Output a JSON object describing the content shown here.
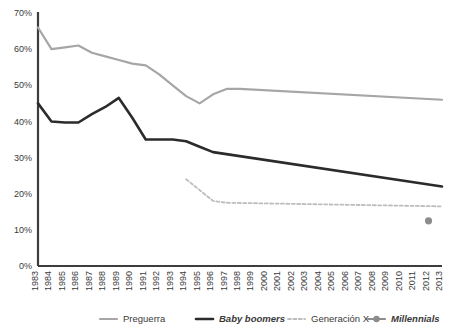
{
  "chart_data": {
    "type": "line",
    "title": "",
    "subtitle": "",
    "xlabel": "",
    "ylabel": "",
    "grid": false,
    "legend_position": "bottom",
    "x": [
      1983,
      1984,
      1985,
      1986,
      1987,
      1988,
      1989,
      1990,
      1991,
      1992,
      1993,
      1994,
      1995,
      1996,
      1997,
      1998,
      1999,
      2000,
      2001,
      2002,
      2003,
      2004,
      2005,
      2006,
      2007,
      2008,
      2009,
      2010,
      2011,
      2012,
      2013
    ],
    "x_tick_labels": [
      "1983",
      "1984",
      "1985",
      "1986",
      "1987",
      "1988",
      "1989",
      "1990",
      "1991",
      "1992",
      "1993",
      "1994",
      "1995",
      "1996",
      "1997",
      "1998",
      "1999",
      "2000",
      "2001",
      "2002",
      "2003",
      "2004",
      "2005",
      "2006",
      "2007",
      "2008",
      "2009",
      "2010",
      "2011",
      "2012",
      "2013"
    ],
    "y_tick_labels": [
      "0%",
      "10%",
      "20%",
      "30%",
      "40%",
      "50%",
      "60%",
      "70%"
    ],
    "y_ticks": [
      0,
      10,
      20,
      30,
      40,
      50,
      60,
      70
    ],
    "ylim": [
      0,
      70
    ],
    "xlim": [
      1983,
      2013
    ],
    "series": [
      {
        "name": "Preguerra",
        "color": "#a6a6a6",
        "style": "solid",
        "width": 2.2,
        "marker": "none",
        "italic": false,
        "bold": false,
        "points": [
          {
            "x": 1983,
            "y": 66
          },
          {
            "x": 1984,
            "y": 60
          },
          {
            "x": 1985,
            "y": 60.5
          },
          {
            "x": 1986,
            "y": 61
          },
          {
            "x": 1987,
            "y": 59
          },
          {
            "x": 1988,
            "y": 58
          },
          {
            "x": 1989,
            "y": 57
          },
          {
            "x": 1990,
            "y": 56
          },
          {
            "x": 1991,
            "y": 55.5
          },
          {
            "x": 1992,
            "y": 53
          },
          {
            "x": 1993,
            "y": 50
          },
          {
            "x": 1994,
            "y": 47
          },
          {
            "x": 1995,
            "y": 45
          },
          {
            "x": 1996,
            "y": 47.5
          },
          {
            "x": 1997,
            "y": 49
          },
          {
            "x": 1998,
            "y": 49
          },
          {
            "x": 2013,
            "y": 46
          }
        ]
      },
      {
        "name": "Baby boomers",
        "color": "#2b2b2b",
        "style": "solid",
        "width": 2.6,
        "marker": "none",
        "italic": true,
        "bold": true,
        "points": [
          {
            "x": 1983,
            "y": 45
          },
          {
            "x": 1984,
            "y": 40
          },
          {
            "x": 1985,
            "y": 39.7
          },
          {
            "x": 1986,
            "y": 39.7
          },
          {
            "x": 1987,
            "y": 42
          },
          {
            "x": 1988,
            "y": 44
          },
          {
            "x": 1989,
            "y": 46.5
          },
          {
            "x": 1990,
            "y": 41
          },
          {
            "x": 1991,
            "y": 35
          },
          {
            "x": 1992,
            "y": 35
          },
          {
            "x": 1993,
            "y": 35
          },
          {
            "x": 1994,
            "y": 34.5
          },
          {
            "x": 1995,
            "y": 33
          },
          {
            "x": 1996,
            "y": 31.5
          },
          {
            "x": 2013,
            "y": 22
          }
        ]
      },
      {
        "name": "Generación X",
        "color": "#bdbdbd",
        "style": "dashed",
        "width": 1.8,
        "marker": "none",
        "italic": false,
        "bold": false,
        "points": [
          {
            "x": 1994,
            "y": 24
          },
          {
            "x": 1995,
            "y": 21
          },
          {
            "x": 1996,
            "y": 18
          },
          {
            "x": 1997,
            "y": 17.5
          },
          {
            "x": 2013,
            "y": 16.5
          }
        ]
      },
      {
        "name": "Millennials",
        "color": "#8c8c8c",
        "style": "solid",
        "width": 2.2,
        "marker": "circle",
        "italic": true,
        "bold": true,
        "points": [
          {
            "x": 2012,
            "y": 12.5
          }
        ]
      }
    ]
  },
  "legend": {
    "items": [
      {
        "label": "Preguerra",
        "key": "legend-item-preguerra"
      },
      {
        "label": "Baby boomers",
        "key": "legend-item-baby-boomers"
      },
      {
        "label": "Generación X",
        "key": "legend-item-generacion-x"
      },
      {
        "label": "Millennials",
        "key": "legend-item-millennials"
      }
    ]
  },
  "colors": {
    "preguerra": "#a6a6a6",
    "baby_boomers": "#2b2b2b",
    "generacion_x": "#bdbdbd",
    "millennials": "#8c8c8c",
    "axis": "#3d3d3d",
    "text": "#3a3a3a",
    "background": "#ffffff"
  }
}
